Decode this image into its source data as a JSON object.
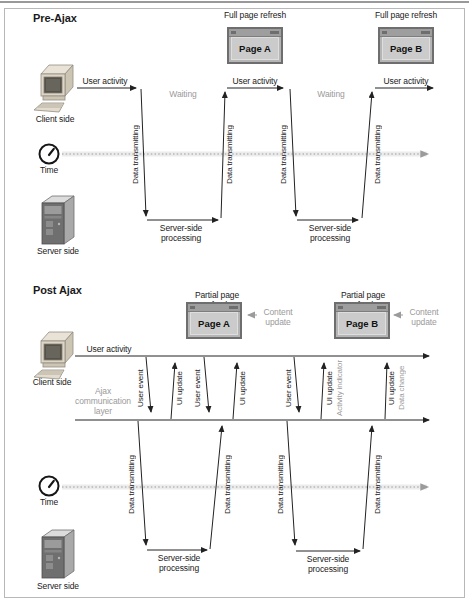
{
  "figure": {
    "pre": {
      "title": "Pre-Ajax",
      "client_label": "Client side",
      "time_label": "Time",
      "server_label": "Server side",
      "windows": [
        {
          "caption": "Full page refresh",
          "page": "Page A"
        },
        {
          "caption": "Full page refresh",
          "page": "Page B"
        }
      ],
      "user_activity_labels": [
        "User activity",
        "User activity",
        "User activity"
      ],
      "waiting_labels": [
        "Waiting",
        "Waiting"
      ],
      "data_transmitting_labels": [
        "Data transmitting",
        "Data transmitting",
        "Data transmitting",
        "Data transmitting"
      ],
      "server_processing_labels": [
        "Server-side processing",
        "Server-side processing"
      ]
    },
    "post": {
      "title": "Post Ajax",
      "client_label": "Client side",
      "time_label": "Time",
      "server_label": "Server side",
      "user_activity_label": "User activity",
      "ajax_layer_label": "Ajax communication layer",
      "windows": [
        {
          "caption": "Partial page refresh",
          "page": "Page A",
          "note": "Content update"
        },
        {
          "caption": "Partial page refresh",
          "page": "Page B",
          "note": "Content update"
        }
      ],
      "event_labels": [
        {
          "label": "User event",
          "direction": "down"
        },
        {
          "label": "UI update",
          "direction": "up"
        },
        {
          "label": "User event",
          "direction": "down"
        },
        {
          "label": "UI update",
          "direction": "up"
        },
        {
          "label": "User event",
          "direction": "down"
        },
        {
          "label": "UI update",
          "sublabel": "Activity indicator",
          "direction": "up"
        },
        {
          "label": "UI update",
          "sublabel": "Data change",
          "direction": "up"
        }
      ],
      "data_transmitting_labels": [
        "Data transmitting",
        "Data transmitting",
        "Data transmitting",
        "Data transmitting"
      ],
      "server_processing_labels": [
        "Server-side processing",
        "Server-side processing"
      ]
    },
    "colors": {
      "line": "#222222",
      "text": "#1a1a1a",
      "muted_text": "#9a9a9a",
      "time_axis": "#9b9b9b",
      "border": "#b8b8b8"
    }
  }
}
